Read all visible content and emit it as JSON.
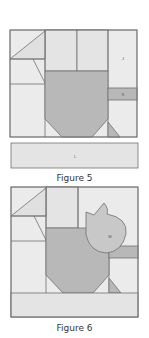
{
  "colors": {
    "light": "#ebebeb",
    "mid": "#dcdcdc",
    "dark": "#b8b8b8",
    "stroke": "#707070",
    "text": "#333333"
  },
  "figure5": {
    "caption": "Figure 5",
    "labels": {
      "J": "J",
      "K": "K",
      "L": "L"
    }
  },
  "figure6": {
    "caption": "Figure 6",
    "labels": {
      "M": "M"
    }
  }
}
